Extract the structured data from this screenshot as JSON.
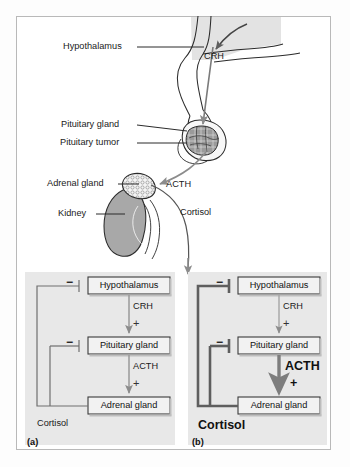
{
  "figure": {
    "frame_color": "#b9b9b9",
    "panel_bg": "#e8e8e8",
    "box_fill": "#f2f2f2",
    "organ_gray": "#a8a8a8",
    "arrow_gray": "#8c8c8c",
    "arrow_dark": "#6f6f6f"
  },
  "anatomy": {
    "labels": [
      {
        "id": "hypothalamus",
        "text": "Hypothalamus"
      },
      {
        "id": "crh",
        "text": "CRH"
      },
      {
        "id": "pituitary-gland",
        "text": "Pituitary gland"
      },
      {
        "id": "pituitary-tumor",
        "text": "Pituitary tumor"
      },
      {
        "id": "adrenal-gland",
        "text": "Adrenal gland"
      },
      {
        "id": "kidney",
        "text": "Kidney"
      },
      {
        "id": "acth",
        "text": "ACTH"
      },
      {
        "id": "cortisol",
        "text": "Cortisol"
      }
    ]
  },
  "panel_a": {
    "tag": "(a)",
    "caption": "normal feedback",
    "boxes": [
      {
        "id": "hypothalamus",
        "label": "Hypothalamus"
      },
      {
        "id": "pituitary-gland",
        "label": "Pituitary gland"
      },
      {
        "id": "adrenal-gland",
        "label": "Adrenal gland"
      }
    ],
    "hormones": [
      {
        "id": "crh",
        "label": "CRH",
        "sign": "+"
      },
      {
        "id": "acth",
        "label": "ACTH",
        "sign": "+"
      }
    ],
    "feedback": {
      "label": "Cortisol",
      "signs": [
        "−",
        "−"
      ]
    }
  },
  "panel_b": {
    "tag": "(b)",
    "caption": "tumour-driven excess",
    "boxes": [
      {
        "id": "hypothalamus",
        "label": "Hypothalamus"
      },
      {
        "id": "pituitary-gland",
        "label": "Pituitary gland"
      },
      {
        "id": "adrenal-gland",
        "label": "Adrenal gland"
      }
    ],
    "hormones": [
      {
        "id": "crh",
        "label": "CRH",
        "sign": "+"
      },
      {
        "id": "acth",
        "label": "ACTH",
        "sign": "+"
      }
    ],
    "feedback": {
      "label": "Cortisol",
      "signs": [
        "−",
        "−"
      ]
    }
  }
}
